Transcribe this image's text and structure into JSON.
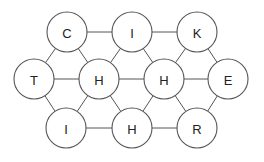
{
  "diagram": {
    "type": "hexagonal-letter-grid",
    "radius": 20,
    "colors": {
      "stroke": "#555555",
      "fill": "#ffffff",
      "text": "#222222"
    },
    "nodes": [
      {
        "id": "n0",
        "label": "C",
        "x": 67,
        "y": 32
      },
      {
        "id": "n1",
        "label": "I",
        "x": 132,
        "y": 32
      },
      {
        "id": "n2",
        "label": "K",
        "x": 197,
        "y": 32
      },
      {
        "id": "n3",
        "label": "T",
        "x": 34,
        "y": 79
      },
      {
        "id": "n4",
        "label": "H",
        "x": 99,
        "y": 79
      },
      {
        "id": "n5",
        "label": "H",
        "x": 164,
        "y": 79
      },
      {
        "id": "n6",
        "label": "E",
        "x": 228,
        "y": 79
      },
      {
        "id": "n7",
        "label": "I",
        "x": 66,
        "y": 128
      },
      {
        "id": "n8",
        "label": "H",
        "x": 132,
        "y": 128
      },
      {
        "id": "n9",
        "label": "R",
        "x": 197,
        "y": 128
      }
    ],
    "edges": [
      [
        "n0",
        "n1"
      ],
      [
        "n1",
        "n2"
      ],
      [
        "n3",
        "n4"
      ],
      [
        "n4",
        "n5"
      ],
      [
        "n5",
        "n6"
      ],
      [
        "n7",
        "n8"
      ],
      [
        "n8",
        "n9"
      ],
      [
        "n0",
        "n3"
      ],
      [
        "n0",
        "n4"
      ],
      [
        "n1",
        "n4"
      ],
      [
        "n1",
        "n5"
      ],
      [
        "n2",
        "n5"
      ],
      [
        "n2",
        "n6"
      ],
      [
        "n3",
        "n7"
      ],
      [
        "n4",
        "n7"
      ],
      [
        "n4",
        "n8"
      ],
      [
        "n5",
        "n8"
      ],
      [
        "n5",
        "n9"
      ],
      [
        "n6",
        "n9"
      ]
    ]
  }
}
